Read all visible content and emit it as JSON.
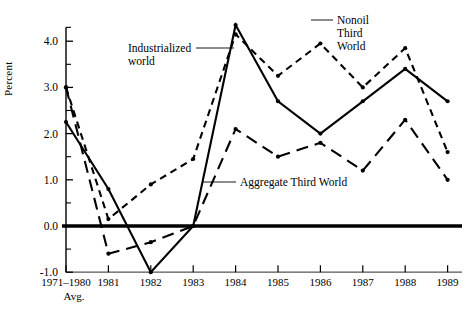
{
  "figure": {
    "axis_label_y": "Percent",
    "x_sublabel": "Avg."
  },
  "annotations": [
    {
      "name": "industrialized-world",
      "lines": [
        "Industrialized",
        "world"
      ]
    },
    {
      "name": "nonoil-third-world",
      "lines": [
        "Nonoil",
        "Third",
        "World"
      ]
    },
    {
      "name": "aggregate-third-world",
      "lines": [
        "Aggregate Third World"
      ]
    }
  ],
  "chart_data": {
    "type": "line",
    "title": "",
    "xlabel": "",
    "ylabel": "Percent",
    "ylim": [
      -1.0,
      4.5
    ],
    "yticks": [
      -1.0,
      0.0,
      1.0,
      2.0,
      3.0,
      4.0
    ],
    "ytick_labels": [
      "-1.0",
      "0.0",
      "1.0",
      "2.0",
      "3.0",
      "4.0"
    ],
    "yminor_ticks": [
      -0.5,
      0.5,
      1.5,
      2.5,
      3.5,
      4.3
    ],
    "grid": false,
    "legend": "inline-annotations",
    "categories": [
      "1971-1980",
      "1981",
      "1982",
      "1983",
      "1984",
      "1985",
      "1986",
      "1987",
      "1988",
      "1989"
    ],
    "xtick_labels": [
      "1971–1980",
      "1981",
      "1982",
      "1983",
      "1984",
      "1985",
      "1986",
      "1987",
      "1988",
      "1989"
    ],
    "zero_line": 0.0,
    "series": [
      {
        "name": "Industrialized world",
        "style": "solid",
        "marker": "dot",
        "values": [
          2.25,
          0.8,
          -1.0,
          0.0,
          4.35,
          2.7,
          2.0,
          2.7,
          3.4,
          2.7
        ]
      },
      {
        "name": "Nonoil Third World",
        "style": "short-dash",
        "marker": "dot",
        "values": [
          3.0,
          0.15,
          0.9,
          1.45,
          4.15,
          3.25,
          3.95,
          3.0,
          3.85,
          1.6
        ]
      },
      {
        "name": "Aggregate Third World",
        "style": "long-dash",
        "marker": "dot",
        "values": [
          3.0,
          -0.6,
          -0.35,
          0.0,
          2.1,
          1.5,
          1.8,
          1.2,
          2.3,
          1.0
        ]
      }
    ]
  }
}
